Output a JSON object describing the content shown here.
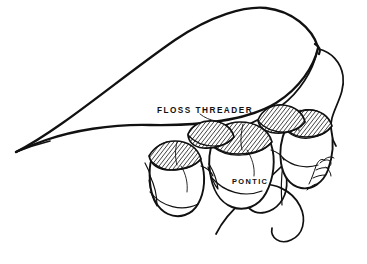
{
  "figure": {
    "style": "black-and-white line drawing",
    "background_color": "#ffffff",
    "ink_color": "#111111",
    "width": 367,
    "height": 264
  },
  "labels": {
    "floss_threader": "FLOSS THREADER",
    "pontic": "PONTIC"
  },
  "annotations": [
    {
      "name": "floss-threader-label",
      "text": "FLOSS THREADER",
      "x": 157,
      "y": 113,
      "points_to": "threader-loop"
    },
    {
      "name": "pontic-label",
      "text": "PONTIC",
      "x": 232,
      "y": 184,
      "points_to": "middle-tooth"
    }
  ],
  "parts": {
    "threader_loop": {
      "name": "floss-threader-loop",
      "description": "large teardrop shaped plastic loop tapering to a point at lower left",
      "tip_x": 16,
      "tip_y": 152,
      "apex_x": 265,
      "apex_y": 8,
      "knot_x": 318,
      "knot_y": 48
    },
    "floss_strands": {
      "name": "floss-strands",
      "count": 2,
      "description": "floss strands running from the threader knot under the pontic and looping below"
    },
    "teeth": [
      {
        "name": "abutment-tooth-mesial",
        "position": "left",
        "kind": "abutment",
        "occlusal_shading": "hatched"
      },
      {
        "name": "pontic-tooth",
        "position": "center",
        "kind": "pontic",
        "occlusal_shading": "hatched"
      },
      {
        "name": "abutment-tooth-distal",
        "position": "right",
        "kind": "abutment",
        "occlusal_shading": "hatched"
      }
    ]
  },
  "signature": {
    "name": "artist-signature",
    "text": "",
    "x": 312,
    "y": 172,
    "description": "small cursive artist signature on the distal tooth"
  }
}
